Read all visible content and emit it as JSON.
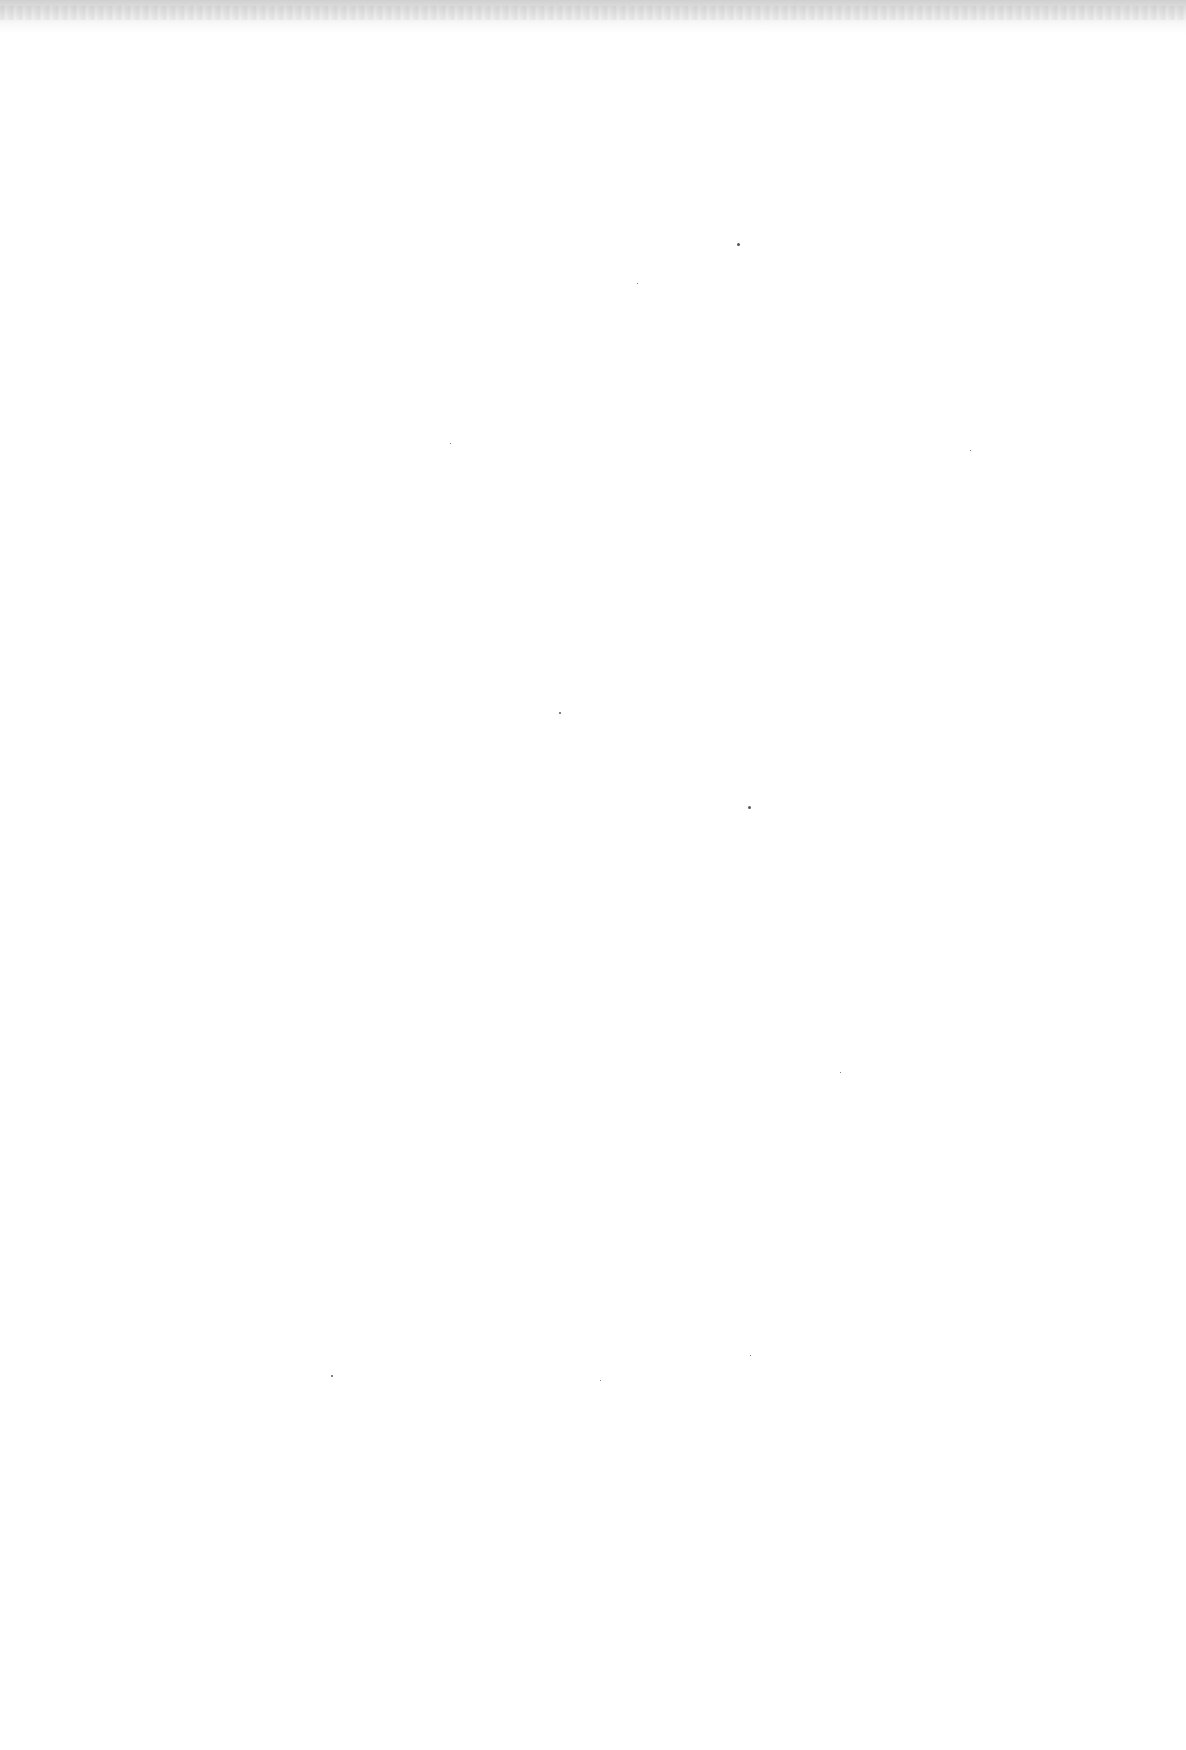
{
  "page": {
    "type": "blank-scanned-page",
    "text": ""
  },
  "specks": [
    {
      "x": 737,
      "y": 243,
      "size": 3
    },
    {
      "x": 748,
      "y": 806,
      "size": 3
    },
    {
      "x": 559,
      "y": 712,
      "size": 2
    },
    {
      "x": 637,
      "y": 283,
      "size": 1
    },
    {
      "x": 331,
      "y": 1375,
      "size": 2
    },
    {
      "x": 750,
      "y": 1355,
      "size": 1
    },
    {
      "x": 600,
      "y": 1380,
      "size": 1
    },
    {
      "x": 450,
      "y": 443,
      "size": 1
    },
    {
      "x": 970,
      "y": 450,
      "size": 1
    },
    {
      "x": 840,
      "y": 1072,
      "size": 1
    }
  ]
}
